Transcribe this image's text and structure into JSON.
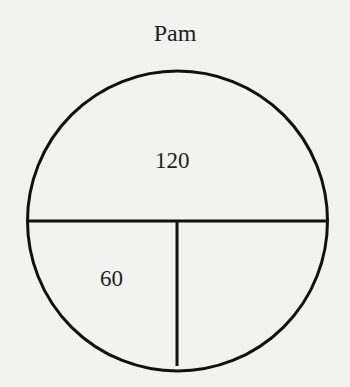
{
  "diagram": {
    "title": "Pam",
    "sections": [
      {
        "id": "top",
        "label": "120"
      },
      {
        "id": "bottom-left",
        "label": "60"
      },
      {
        "id": "bottom-right",
        "label": ""
      }
    ],
    "stroke_color": "#111111"
  }
}
